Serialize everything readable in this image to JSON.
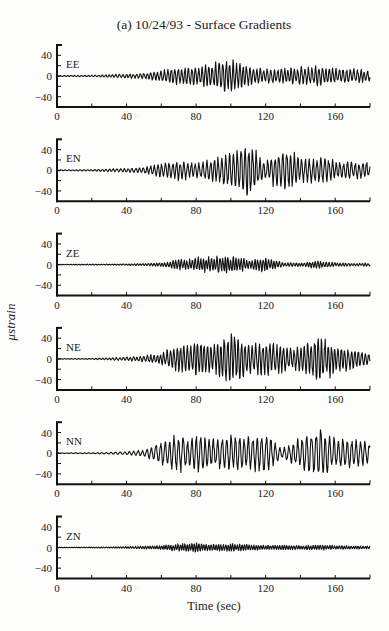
{
  "chart_data": {
    "type": "line",
    "title": "(a) 10/24/93 - Surface Gradients",
    "xlabel": "Time (sec)",
    "ylabel": "μstrain",
    "xlim": [
      0,
      180
    ],
    "ylim": [
      -60,
      60
    ],
    "x_ticks": [
      0,
      40,
      80,
      120,
      160
    ],
    "x_minor_step": 20,
    "y_ticks": [
      40,
      0,
      -40
    ],
    "y_minor_step": 20,
    "grid": false,
    "sample_step_sec": 0.25,
    "envelope_time_knots": [
      0,
      20,
      30,
      40,
      50,
      60,
      70,
      80,
      90,
      100,
      110,
      120,
      130,
      140,
      150,
      160,
      170,
      180
    ],
    "series": [
      {
        "name": "EE",
        "envelope": [
          1,
          1.5,
          3,
          4,
          6,
          12,
          18,
          20,
          25,
          35,
          20,
          15,
          14,
          18,
          20,
          15,
          14,
          12
        ],
        "period_sec": 2.0
      },
      {
        "name": "EN",
        "envelope": [
          1,
          1.5,
          3,
          4,
          6,
          14,
          20,
          15,
          22,
          35,
          55,
          20,
          45,
          25,
          28,
          18,
          17,
          15
        ],
        "period_sec": 2.2
      },
      {
        "name": "ZE",
        "envelope": [
          0.5,
          1,
          1,
          1.5,
          2,
          4,
          10,
          14,
          16,
          18,
          10,
          14,
          4,
          4,
          8,
          4,
          3,
          3
        ],
        "period_sec": 1.6
      },
      {
        "name": "NE",
        "envelope": [
          0.5,
          1,
          2,
          4,
          6,
          12,
          30,
          35,
          30,
          55,
          30,
          35,
          28,
          25,
          45,
          30,
          20,
          12
        ],
        "period_sec": 2.0
      },
      {
        "name": "NN",
        "envelope": [
          0.5,
          1,
          2,
          3,
          6,
          25,
          35,
          35,
          30,
          38,
          35,
          40,
          10,
          30,
          55,
          30,
          28,
          22
        ],
        "period_sec": 2.6
      },
      {
        "name": "ZN",
        "envelope": [
          0.5,
          1,
          1,
          2,
          3,
          4,
          8,
          9,
          7,
          8,
          6,
          5,
          5,
          4,
          5,
          4,
          3,
          3
        ],
        "period_sec": 1.4
      }
    ]
  }
}
